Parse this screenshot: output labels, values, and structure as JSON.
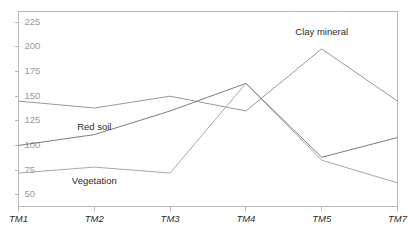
{
  "chart_data": {
    "type": "line",
    "title": "",
    "subtitle": "",
    "xlabel": "",
    "ylabel": "",
    "categories": [
      "TM1",
      "TM2",
      "TM3",
      "TM4",
      "TM5",
      "TM7"
    ],
    "x_tick_labels": [
      "TM1",
      "TM2",
      "TM3",
      "TM4",
      "TM5",
      "TM7"
    ],
    "y_tick_labels": [
      "225",
      "200",
      "175",
      "150",
      "125",
      "100",
      "75",
      "50"
    ],
    "y_ticks": [
      225,
      200,
      175,
      150,
      125,
      100,
      75,
      50
    ],
    "ylim": [
      38,
      236
    ],
    "grid": false,
    "legend": "inline-labels",
    "legend_position": "inline",
    "frame_color": "#b9b9b9",
    "series": [
      {
        "name": "Clay mineral",
        "label": "Clay mineral",
        "color": "#8c8c8c",
        "values": [
          145,
          138,
          150,
          135,
          198,
          145
        ],
        "label_x_category": "TM5",
        "label_value": 215
      },
      {
        "name": "Red soil",
        "label": "Red soil",
        "color": "#6e6e6e",
        "values": [
          100,
          111,
          135,
          163,
          88,
          108
        ],
        "label_x_category": "TM2",
        "label_value": 118
      },
      {
        "name": "Vegetation",
        "label": "Vegetation",
        "color": "#9e9e9e",
        "values": [
          72,
          78,
          72,
          163,
          85,
          62
        ],
        "label_x_category": "TM2",
        "label_value": 63
      }
    ]
  }
}
